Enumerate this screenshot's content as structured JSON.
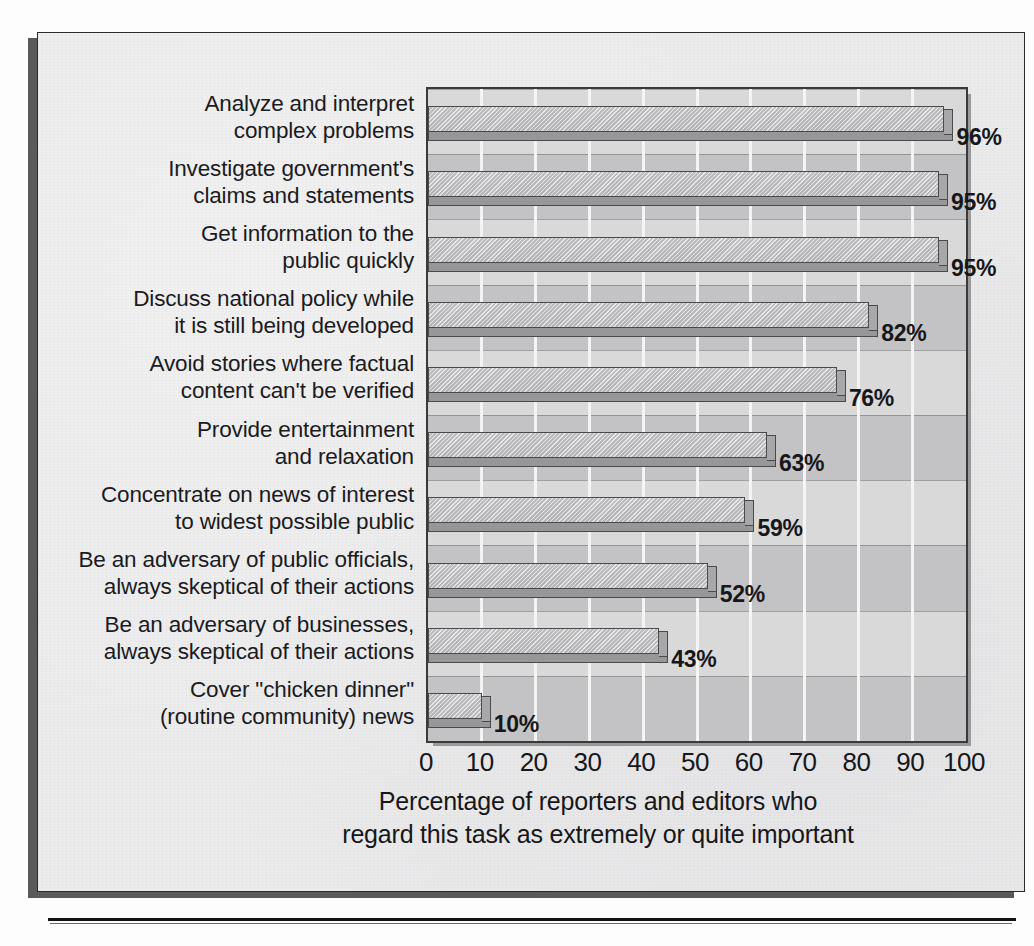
{
  "figure": {
    "background_color": "#ececed",
    "plot_background_color": "#d2d2d3",
    "bar_color": "#cfcfd1",
    "bar_edge_color": "#4a4a4c",
    "text_color": "#17171a"
  },
  "chart_data": {
    "type": "bar",
    "orientation": "horizontal",
    "title": "",
    "xlabel": "Percentage of reporters and editors who\nregard this task as extremely or quite important",
    "ylabel": "",
    "xlim": [
      0,
      100
    ],
    "xticks": [
      0,
      10,
      20,
      30,
      40,
      50,
      60,
      70,
      80,
      90,
      100
    ],
    "xtick_labels": [
      "0",
      "10",
      "20",
      "30",
      "40",
      "50",
      "60",
      "70",
      "80",
      "90",
      "100"
    ],
    "grid": "vertical-only",
    "legend": "none",
    "categories": [
      "Analyze and interpret\ncomplex problems",
      "Investigate government's\nclaims and statements",
      "Get information to the\npublic quickly",
      "Discuss national policy while\nit is still being developed",
      "Avoid stories where factual\ncontent can't be verified",
      "Provide entertainment\nand relaxation",
      "Concentrate on news of interest\nto widest possible public",
      "Be an adversary of public officials,\nalways skeptical of their actions",
      "Be an adversary of businesses,\nalways skeptical of their actions",
      "Cover \"chicken dinner\"\n(routine community) news"
    ],
    "values": [
      96,
      95,
      95,
      82,
      76,
      63,
      59,
      52,
      43,
      10
    ],
    "data_labels": [
      "96%",
      "95%",
      "95%",
      "82%",
      "76%",
      "63%",
      "59%",
      "52%",
      "43%",
      "10%"
    ]
  },
  "axis": {
    "caption_line1": "Percentage of reporters and editors who",
    "caption_line2": "regard this task as extremely or quite important"
  }
}
